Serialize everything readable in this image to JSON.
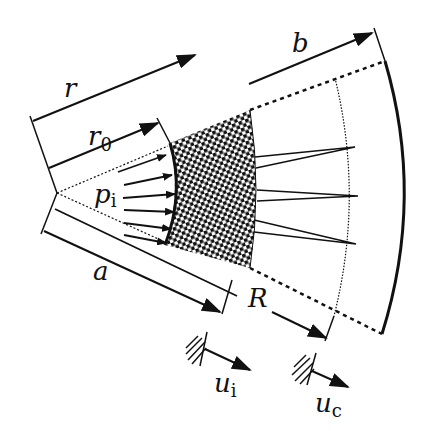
{
  "diagram": {
    "colors": {
      "ink": "#111111",
      "background": "#ffffff"
    },
    "labels": {
      "r": {
        "main": "r",
        "sub": ""
      },
      "r0": {
        "main": "r",
        "sub": "0"
      },
      "pi": {
        "main": "p",
        "sub": "i"
      },
      "a": {
        "main": "a",
        "sub": ""
      },
      "b": {
        "main": "b",
        "sub": ""
      },
      "R": {
        "main": "R",
        "sub": ""
      },
      "ui": {
        "main": "u",
        "sub": "i"
      },
      "uc": {
        "main": "u",
        "sub": "c"
      }
    },
    "regions": [
      {
        "name": "cavity",
        "boundary": "inner arc at radius a"
      },
      {
        "name": "plastic-zone",
        "fill": "checker pattern"
      },
      {
        "name": "cracked-zone",
        "boundary": "dotted arc at radius R",
        "cracks": 3
      },
      {
        "name": "elastic-zone",
        "boundary": "outer solid arc at radius b"
      }
    ],
    "pressure_arrow_count": 7
  }
}
